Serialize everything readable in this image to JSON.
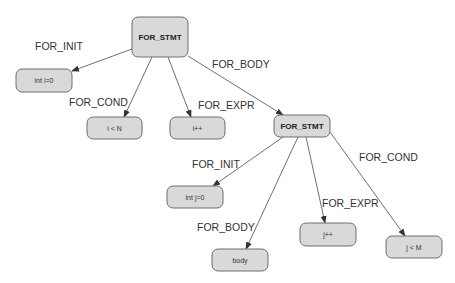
{
  "diagram": {
    "title": "",
    "nodes": [
      {
        "id": "for1",
        "label": "FOR_STMT",
        "x": 132,
        "y": 17,
        "w": 56,
        "h": 40,
        "bold": true
      },
      {
        "id": "init1",
        "label": "int i=0",
        "x": 16,
        "y": 69,
        "w": 56,
        "h": 23,
        "bold": false
      },
      {
        "id": "cond1",
        "label": "i < N",
        "x": 87,
        "y": 117,
        "w": 55,
        "h": 22,
        "bold": false
      },
      {
        "id": "expr1",
        "label": "i++",
        "x": 170,
        "y": 117,
        "w": 55,
        "h": 22,
        "bold": false
      },
      {
        "id": "for2",
        "label": "FOR_STMT",
        "x": 274,
        "y": 115,
        "w": 56,
        "h": 22,
        "bold": true
      },
      {
        "id": "init2",
        "label": "int j=0",
        "x": 167,
        "y": 186,
        "w": 56,
        "h": 22,
        "bold": false
      },
      {
        "id": "body2",
        "label": "body",
        "x": 212,
        "y": 249,
        "w": 56,
        "h": 22,
        "bold": false
      },
      {
        "id": "expr2",
        "label": "j++",
        "x": 300,
        "y": 223,
        "w": 56,
        "h": 23,
        "bold": false
      },
      {
        "id": "cond2",
        "label": "j < M",
        "x": 386,
        "y": 236,
        "w": 56,
        "h": 22,
        "bold": false
      }
    ],
    "edges": [
      {
        "from": "for1",
        "to": "init1",
        "label": "FOR_INIT",
        "x1": 132,
        "y1": 49,
        "x2": 72,
        "y2": 71,
        "lx": 35,
        "ly": 50
      },
      {
        "from": "for1",
        "to": "cond1",
        "label": "FOR_COND",
        "x1": 152,
        "y1": 57,
        "x2": 124,
        "y2": 117,
        "lx": 69,
        "ly": 106
      },
      {
        "from": "for1",
        "to": "expr1",
        "label": "FOR_EXPR",
        "x1": 168,
        "y1": 57,
        "x2": 191,
        "y2": 117,
        "lx": 198,
        "ly": 109
      },
      {
        "from": "for1",
        "to": "for2",
        "label": "FOR_BODY",
        "x1": 188,
        "y1": 56,
        "x2": 283,
        "y2": 115,
        "lx": 212,
        "ly": 68
      },
      {
        "from": "for2",
        "to": "init2",
        "label": "FOR_INIT",
        "x1": 283,
        "y1": 137,
        "x2": 213,
        "y2": 186,
        "lx": 192,
        "ly": 168
      },
      {
        "from": "for2",
        "to": "body2",
        "label": "FOR_BODY",
        "x1": 298,
        "y1": 137,
        "x2": 246,
        "y2": 249,
        "lx": 197,
        "ly": 231
      },
      {
        "from": "for2",
        "to": "expr2",
        "label": "FOR_EXPR",
        "x1": 306,
        "y1": 137,
        "x2": 325,
        "y2": 223,
        "lx": 322,
        "ly": 207
      },
      {
        "from": "for2",
        "to": "cond2",
        "label": "FOR_COND",
        "x1": 330,
        "y1": 132,
        "x2": 405,
        "y2": 236,
        "lx": 359,
        "ly": 161
      }
    ]
  }
}
